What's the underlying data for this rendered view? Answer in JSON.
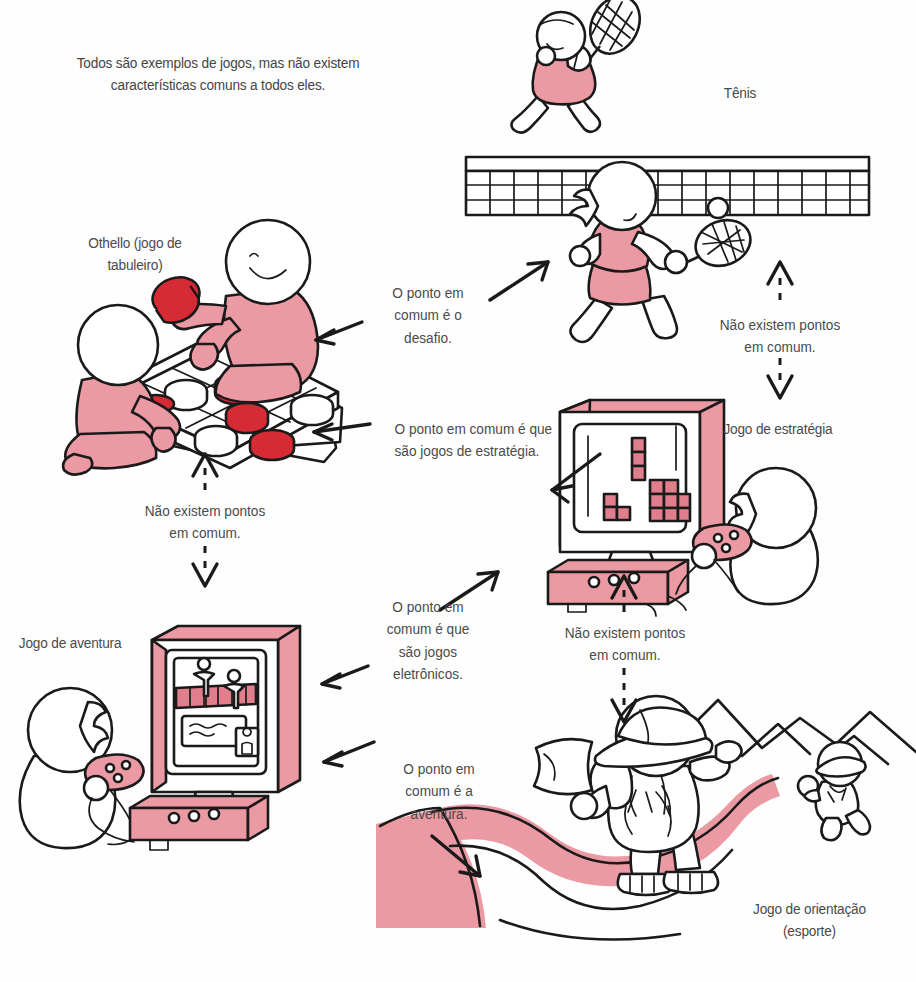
{
  "figure": {
    "intro_text": "Todos são exemplos de jogos, mas não existem\ncaracterísticas comuns a todos eles.",
    "colors": {
      "ink": "#1a1a1a",
      "pink": "#eb99a2",
      "pink_dark": "#e07f8b",
      "red": "#d62b35",
      "text": "#4a4a4a",
      "paper": "#fefefe"
    }
  },
  "items": [
    {
      "id": "tenis",
      "label": "Tênis"
    },
    {
      "id": "othello",
      "label": "Othello (jogo de\ntabuleiro)"
    },
    {
      "id": "estrategia",
      "label": "Jogo de estratégia"
    },
    {
      "id": "aventura",
      "label": "Jogo de aventura"
    },
    {
      "id": "orientacao",
      "label": "Jogo de orientação\n(esporte)"
    }
  ],
  "connections": [
    {
      "id": "othello-tenis",
      "text": "O ponto em\ncomum é o\ndesafio."
    },
    {
      "id": "othello-estrategia",
      "text": "O ponto em comum é que\nsão jogos de estratégia."
    },
    {
      "id": "aventura-estrategia",
      "text": "O ponto em\ncomum é que\nsão jogos\neletrônicos."
    },
    {
      "id": "aventura-orientacao",
      "text": "O ponto em\ncomum é a\naventura."
    }
  ],
  "no_common": [
    {
      "id": "tenis-estrategia",
      "text": "Não existem pontos\nem comum."
    },
    {
      "id": "othello-aventura",
      "text": "Não existem pontos\nem comum."
    },
    {
      "id": "estrategia-orientacao",
      "text": "Não existem pontos\nem comum."
    }
  ]
}
